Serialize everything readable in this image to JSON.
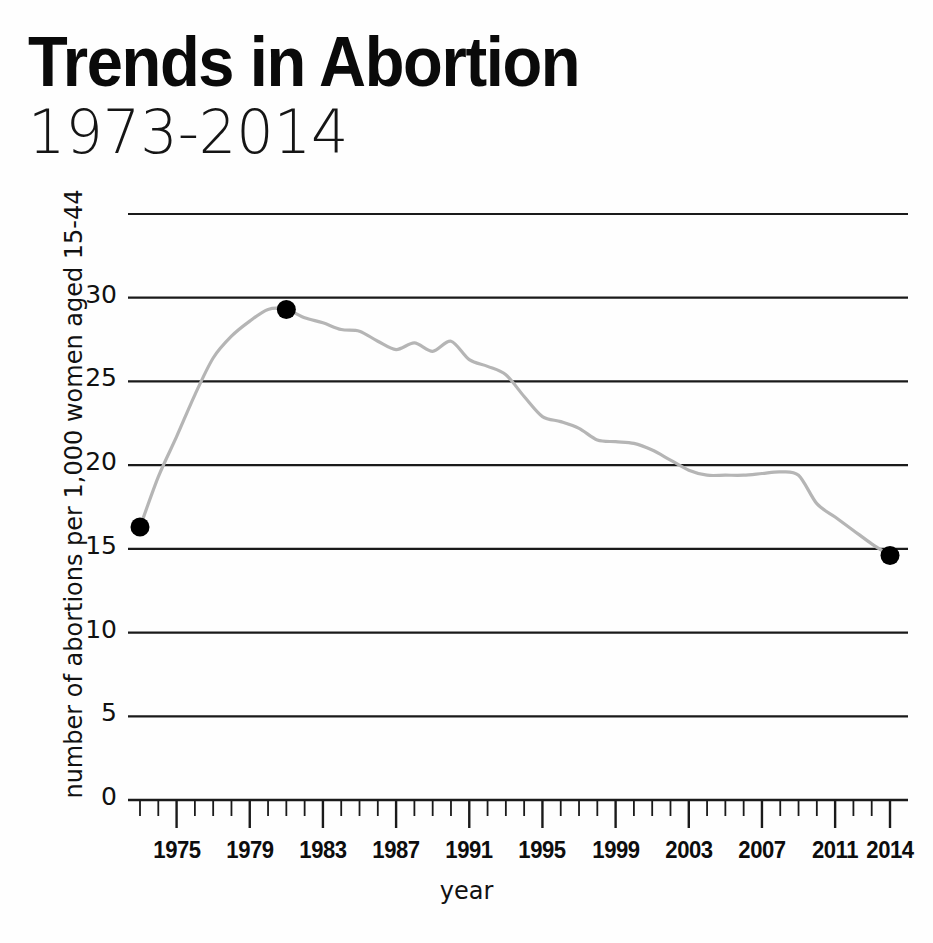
{
  "header": {
    "title": "Trends in Abortion",
    "subtitle": "1973-2014"
  },
  "chart_data": {
    "type": "line",
    "title": "Trends in Abortion",
    "subtitle": "1973-2014",
    "xlabel": "year",
    "ylabel": "number of abortions per 1,000 women aged 15-44",
    "xlim": [
      1973,
      2014
    ],
    "ylim": [
      0,
      35
    ],
    "grid": true,
    "legend": null,
    "y_ticks": [
      0,
      5,
      10,
      15,
      20,
      25,
      30
    ],
    "y_gridlines": [
      0,
      5,
      10,
      15,
      20,
      25,
      30,
      35
    ],
    "x_ticks_labeled": [
      "1975",
      "1979",
      "1983",
      "1987",
      "1991",
      "1995",
      "1999",
      "2003",
      "2007",
      "2011",
      "2014"
    ],
    "x_minor_tick_interval": 1,
    "line_color": "#b5b5b5",
    "marker_color": "#000000",
    "markers": [
      {
        "x": 1973,
        "y": 16.3,
        "label": "start"
      },
      {
        "x": 1981,
        "y": 29.3,
        "label": "peak"
      },
      {
        "x": 2014,
        "y": 14.6,
        "label": "end"
      }
    ],
    "x": [
      1973,
      1974,
      1975,
      1976,
      1977,
      1978,
      1979,
      1980,
      1981,
      1982,
      1983,
      1984,
      1985,
      1986,
      1987,
      1988,
      1989,
      1990,
      1991,
      1992,
      1993,
      1994,
      1995,
      1996,
      1997,
      1998,
      1999,
      2000,
      2001,
      2002,
      2003,
      2004,
      2005,
      2006,
      2007,
      2008,
      2009,
      2010,
      2011,
      2012,
      2013,
      2014
    ],
    "values": [
      16.3,
      19.3,
      21.7,
      24.2,
      26.4,
      27.7,
      28.6,
      29.3,
      29.3,
      28.8,
      28.5,
      28.1,
      28.0,
      27.4,
      26.9,
      27.3,
      26.8,
      27.4,
      26.3,
      25.9,
      25.4,
      24.1,
      22.9,
      22.6,
      22.2,
      21.5,
      21.4,
      21.3,
      20.9,
      20.3,
      19.7,
      19.4,
      19.4,
      19.4,
      19.5,
      19.6,
      19.4,
      17.7,
      16.9,
      16.1,
      15.3,
      14.6
    ]
  },
  "axis_labels": {
    "y": [
      {
        "value": "30",
        "y": 30
      },
      {
        "value": "25",
        "y": 25
      },
      {
        "value": "20",
        "y": 20
      },
      {
        "value": "15",
        "y": 15
      },
      {
        "value": "10",
        "y": 10
      },
      {
        "value": "5",
        "y": 5
      },
      {
        "value": "0",
        "y": 0
      }
    ],
    "x": [
      {
        "label": "1975",
        "year": 1975
      },
      {
        "label": "1979",
        "year": 1979
      },
      {
        "label": "1983",
        "year": 1983
      },
      {
        "label": "1987",
        "year": 1987
      },
      {
        "label": "1991",
        "year": 1991
      },
      {
        "label": "1995",
        "year": 1995
      },
      {
        "label": "1999",
        "year": 1999
      },
      {
        "label": "2003",
        "year": 2003
      },
      {
        "label": "2007",
        "year": 2007
      },
      {
        "label": "2011",
        "year": 2011
      },
      {
        "label": "2014",
        "year": 2014
      }
    ]
  }
}
